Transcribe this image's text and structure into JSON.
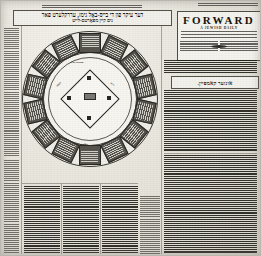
{
  "document": {
    "kind": "newspaper-scan",
    "language": "Yiddish",
    "page_width": 261,
    "page_height": 256
  },
  "masthead": {
    "title": "FORWARD",
    "subtitle": "A JEWISH DAILY",
    "publisher_line": "Published by the FORWARD ASSOCIATION",
    "address_line": "175 E. Broadway, New York, N.Y.",
    "entered_line": "Entered as second class matter at the Post Office, New York, N. Y.",
    "left_column_heading": "SUBSCRIPTION RATES",
    "right_column_heading": "ADVERTISING RATES",
    "ornament": "diamond-ornament",
    "top_strip": "volume-and-date-strip"
  },
  "headline": {
    "kicker": "kicker-rule",
    "line1": "דער עיקר פון די בייס-באָל גימז, עררקלערט פאר",
    "line2": "נים קיין מפאָרטם-לייט"
  },
  "subheadline": {
    "box_text": "אונזער קאמפיין."
  },
  "diagram": {
    "name": "baseball-field-diagram",
    "ring_segment_count": 14,
    "segments": [
      {
        "id": 1,
        "label": "segment-text"
      },
      {
        "id": 2,
        "label": "segment-text"
      },
      {
        "id": 3,
        "label": "segment-text"
      },
      {
        "id": 4,
        "label": "segment-text"
      },
      {
        "id": 5,
        "label": "segment-text"
      },
      {
        "id": 6,
        "label": "segment-text"
      },
      {
        "id": 7,
        "label": "segment-text"
      },
      {
        "id": 8,
        "label": "segment-text"
      },
      {
        "id": 9,
        "label": "segment-text"
      },
      {
        "id": 10,
        "label": "segment-text"
      },
      {
        "id": 11,
        "label": "segment-text"
      },
      {
        "id": 12,
        "label": "segment-text"
      },
      {
        "id": 13,
        "label": "segment-text"
      },
      {
        "id": 14,
        "label": "segment-text"
      }
    ],
    "field_labels": {
      "center_field": "סענטער פילד",
      "left_field": "לעפט",
      "right_field": "רייט",
      "pitcher": "פיטשער",
      "home_plate": "האָום פלייט"
    },
    "bases": [
      "home",
      "first",
      "second",
      "third"
    ],
    "mound": "pitchers-box"
  },
  "columns": {
    "left_margin": {
      "name": "left-margin-column",
      "lines": 60
    },
    "lower_left": {
      "name": "lower-left-column",
      "lines": 34
    },
    "lower_mid_a": {
      "name": "lower-mid-column-a",
      "lines": 34
    },
    "lower_mid_b": {
      "name": "lower-mid-column-b",
      "lines": 34
    },
    "right_upper": {
      "name": "right-upper-column",
      "lines": 30
    },
    "right_lower": {
      "name": "right-lower-column",
      "lines": 46
    },
    "far_left_lower": {
      "name": "far-left-lower-column",
      "lines": 30
    }
  },
  "colors": {
    "paper": "#e9e7e1",
    "ink": "#1a1815",
    "segment_fill": "#56544d",
    "rule": "#6e6b63"
  }
}
